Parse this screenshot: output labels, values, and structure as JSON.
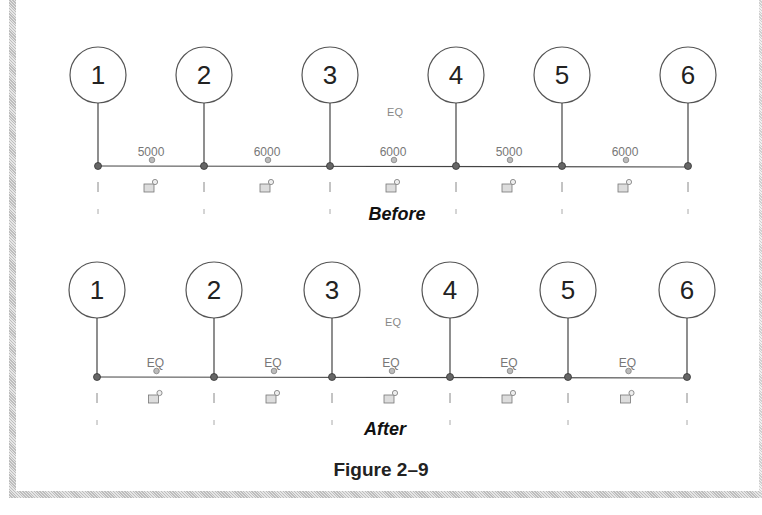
{
  "figure": {
    "caption": "Figure 2–9",
    "panels": [
      {
        "id": "before",
        "title": "Before",
        "grid_labels": [
          "1",
          "2",
          "3",
          "4",
          "5",
          "6"
        ],
        "grid_x": [
          98,
          204,
          330,
          456,
          562,
          688
        ],
        "circle_y": 75,
        "line_y": 166,
        "overall_label": "EQ",
        "dimensions": [
          "5000",
          "6000",
          "6000",
          "5000",
          "6000"
        ]
      },
      {
        "id": "after",
        "title": "After",
        "grid_labels": [
          "1",
          "2",
          "3",
          "4",
          "5",
          "6"
        ],
        "grid_x": [
          97,
          214,
          332,
          450,
          568,
          687
        ],
        "circle_y": 290,
        "line_y": 377,
        "overall_label": "EQ",
        "dimensions": [
          "EQ",
          "EQ",
          "EQ",
          "EQ",
          "EQ"
        ]
      }
    ]
  },
  "icons": {
    "grid_head": "grid-bubble-icon",
    "lock": "dimension-lock-icon",
    "text_grip": "drag-grip-icon"
  },
  "colors": {
    "line": "#444444",
    "circle_stroke": "#555555",
    "dim_text": "#777777",
    "frame_hatch": "#bdbdbd"
  }
}
